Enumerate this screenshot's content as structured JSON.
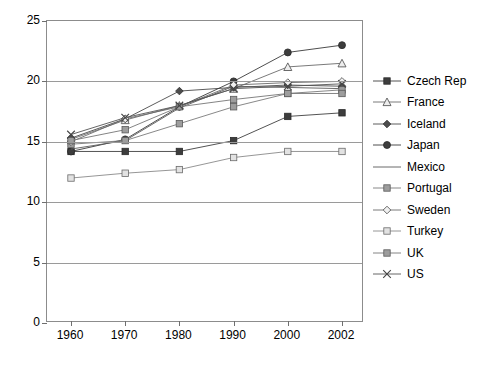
{
  "chart_data": {
    "type": "line",
    "title": "",
    "xlabel": "",
    "ylabel": "",
    "categories": [
      "1960",
      "1970",
      "1980",
      "1990",
      "2000",
      "2002"
    ],
    "ylim": [
      0,
      25
    ],
    "yticks": [
      0,
      5,
      10,
      15,
      20,
      25
    ],
    "grid": true,
    "legend_position": "right",
    "series": [
      {
        "name": "Czech Rep",
        "marker": "filled-square",
        "color": "#404040",
        "values": [
          14.2,
          14.2,
          14.2,
          15.1,
          17.1,
          17.4
        ]
      },
      {
        "name": "France",
        "marker": "open-triangle",
        "color": "#6b6b6b",
        "values": [
          15.2,
          16.8,
          18.0,
          19.4,
          21.2,
          21.5
        ]
      },
      {
        "name": "Iceland",
        "marker": "filled-diamond",
        "color": "#4a4a4a",
        "values": [
          15.3,
          16.9,
          19.2,
          19.5,
          19.7,
          19.6
        ]
      },
      {
        "name": "Japan",
        "marker": "filled-circle",
        "color": "#3a3a3a",
        "values": [
          14.2,
          15.2,
          17.9,
          20.0,
          22.4,
          23.0
        ]
      },
      {
        "name": "Mexico",
        "marker": "none",
        "color": "#5a5a5a",
        "values": [
          14.4,
          15.1,
          17.8,
          19.6,
          19.5,
          19.4
        ]
      },
      {
        "name": "Portugal",
        "marker": "gray-square",
        "color": "#7a7a7a",
        "values": [
          14.8,
          15.1,
          16.5,
          17.9,
          19.0,
          19.3
        ]
      },
      {
        "name": "Sweden",
        "marker": "open-diamond",
        "color": "#6b6b6b",
        "values": [
          15.0,
          16.9,
          17.9,
          19.7,
          19.9,
          20.0
        ]
      },
      {
        "name": "Turkey",
        "marker": "open-square",
        "color": "#8a8a8a",
        "values": [
          12.0,
          12.4,
          12.7,
          13.7,
          14.2,
          14.2
        ]
      },
      {
        "name": "UK",
        "marker": "gray-square",
        "color": "#767676",
        "values": [
          15.1,
          16.0,
          17.9,
          18.5,
          19.0,
          19.0
        ]
      },
      {
        "name": "US",
        "marker": "cross-x",
        "color": "#555555",
        "values": [
          15.6,
          17.0,
          18.0,
          19.4,
          19.6,
          19.8
        ]
      }
    ]
  },
  "axis": {
    "y_tick_labels": [
      "0",
      "5",
      "10",
      "15",
      "20",
      "25"
    ],
    "x_tick_labels": [
      "1960",
      "1970",
      "1980",
      "1990",
      "2000",
      "2002"
    ]
  },
  "legend": {
    "items": [
      {
        "label": "Czech Rep"
      },
      {
        "label": "France"
      },
      {
        "label": "Iceland"
      },
      {
        "label": "Japan"
      },
      {
        "label": "Mexico"
      },
      {
        "label": "Portugal"
      },
      {
        "label": "Sweden"
      },
      {
        "label": "Turkey"
      },
      {
        "label": "UK"
      },
      {
        "label": "US"
      }
    ]
  }
}
